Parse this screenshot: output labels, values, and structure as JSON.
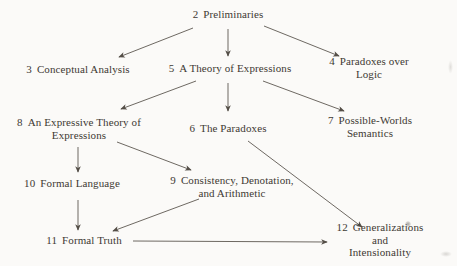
{
  "figure": {
    "background_color": "#fbfaf8",
    "text_color": "#3e3933",
    "arrow_color": "#544e47",
    "nodes": [
      {
        "id": "preliminaries",
        "number": "2",
        "label": "Preliminaries",
        "x": 228,
        "y": 14
      },
      {
        "id": "conceptual-analysis",
        "number": "3",
        "label": "Conceptual Analysis",
        "x": 78,
        "y": 69
      },
      {
        "id": "theory-of-expressions",
        "number": "5",
        "label": "A Theory of Expressions",
        "x": 230,
        "y": 68
      },
      {
        "id": "paradoxes-over-logic",
        "number": "4",
        "label": "Paradoxes over Logic",
        "x": 369,
        "y": 68
      },
      {
        "id": "expressive-theory",
        "number": "8",
        "label": "An Expressive Theory of\nExpressions",
        "x": 79,
        "y": 129
      },
      {
        "id": "the-paradoxes",
        "number": "6",
        "label": "The Paradoxes",
        "x": 228,
        "y": 128
      },
      {
        "id": "possible-worlds",
        "number": "7",
        "label": "Possible-Worlds Semantics",
        "x": 370,
        "y": 127
      },
      {
        "id": "formal-language",
        "number": "10",
        "label": "Formal Language",
        "x": 72,
        "y": 183
      },
      {
        "id": "consistency-denotation",
        "number": "9",
        "label": "Consistency, Denotation,\nand Arithmetic",
        "x": 232,
        "y": 187
      },
      {
        "id": "formal-truth",
        "number": "11",
        "label": "Formal Truth",
        "x": 84,
        "y": 240
      },
      {
        "id": "generalizations",
        "number": "12",
        "label": "Generalizations and\nIntensionality",
        "x": 380,
        "y": 240
      }
    ],
    "edges": [
      {
        "from": "2",
        "to": "3",
        "x1": 193,
        "y1": 28,
        "x2": 119,
        "y2": 57
      },
      {
        "from": "2",
        "to": "5",
        "x1": 228,
        "y1": 29,
        "x2": 228,
        "y2": 56
      },
      {
        "from": "2",
        "to": "4",
        "x1": 264,
        "y1": 26,
        "x2": 339,
        "y2": 56
      },
      {
        "from": "5",
        "to": "8",
        "x1": 196,
        "y1": 81,
        "x2": 121,
        "y2": 109
      },
      {
        "from": "5",
        "to": "6",
        "x1": 228,
        "y1": 83,
        "x2": 228,
        "y2": 111
      },
      {
        "from": "5",
        "to": "7",
        "x1": 263,
        "y1": 81,
        "x2": 344,
        "y2": 111
      },
      {
        "from": "8",
        "to": "10",
        "x1": 78,
        "y1": 147,
        "x2": 78,
        "y2": 172
      },
      {
        "from": "8",
        "to": "9",
        "x1": 117,
        "y1": 142,
        "x2": 191,
        "y2": 170
      },
      {
        "from": "6",
        "to": "12",
        "x1": 248,
        "y1": 141,
        "x2": 362,
        "y2": 227
      },
      {
        "from": "10",
        "to": "11",
        "x1": 78,
        "y1": 200,
        "x2": 78,
        "y2": 230
      },
      {
        "from": "9",
        "to": "11",
        "x1": 199,
        "y1": 199,
        "x2": 113,
        "y2": 231
      },
      {
        "from": "11",
        "to": "12",
        "x1": 133,
        "y1": 241,
        "x2": 327,
        "y2": 242
      }
    ]
  }
}
